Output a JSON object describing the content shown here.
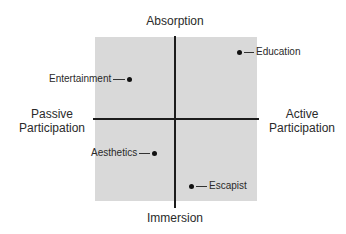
{
  "diagram": {
    "axes": {
      "top": "Absorption",
      "bottom": "Immersion",
      "left_line1": "Passive",
      "left_line2": "Participation",
      "right_line1": "Active",
      "right_line2": "Participation"
    },
    "points": [
      {
        "label": "Education",
        "quadrant": "top-right"
      },
      {
        "label": "Entertainment",
        "quadrant": "top-left"
      },
      {
        "label": "Aesthetics",
        "quadrant": "bottom-left"
      },
      {
        "label": "Escapist",
        "quadrant": "bottom-right"
      }
    ],
    "colors": {
      "quadrant_fill": "#d9d9d9",
      "axis_line": "#1c1c1c",
      "text": "#2a2a2a"
    }
  }
}
